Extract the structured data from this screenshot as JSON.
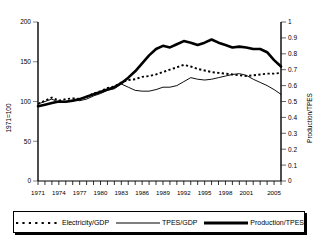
{
  "chart_data": {
    "type": "line",
    "title": "",
    "xlabel": "",
    "ylabel": "1971=100",
    "y2label": "Production/TPES",
    "xlim": [
      1971,
      2006
    ],
    "ylim": [
      0,
      200
    ],
    "y2lim": [
      0,
      1
    ],
    "grid": false,
    "legend_position": "bottom",
    "yticks": [
      "0",
      "50",
      "100",
      "150",
      "200"
    ],
    "y2ticks": [
      "0",
      "0.1",
      "0.2",
      "0.3",
      "0.4",
      "0.5",
      "0.6",
      "0.7",
      "0.8",
      "0.9",
      "1"
    ],
    "xticks": [
      "1971",
      "1974",
      "1977",
      "1980",
      "1983",
      "1986",
      "1989",
      "1992",
      "1995",
      "1998",
      "2001",
      "2005"
    ],
    "x": [
      1971,
      1972,
      1973,
      1974,
      1975,
      1976,
      1977,
      1978,
      1979,
      1980,
      1981,
      1982,
      1983,
      1984,
      1985,
      1986,
      1987,
      1988,
      1989,
      1990,
      1991,
      1992,
      1993,
      1994,
      1995,
      1996,
      1997,
      1998,
      1999,
      2000,
      2001,
      2002,
      2003,
      2004,
      2005,
      2006
    ],
    "series": [
      {
        "name": "Electricity/GDP",
        "axis": "left",
        "style": "dotted",
        "color": "#000000",
        "values": [
          97,
          101,
          105,
          101,
          103,
          104,
          103,
          106,
          110,
          113,
          117,
          119,
          124,
          127,
          128,
          131,
          132,
          134,
          137,
          140,
          143,
          146,
          144,
          141,
          139,
          137,
          136,
          135,
          134,
          133,
          132,
          133,
          134,
          135,
          135,
          136
        ]
      },
      {
        "name": "TPES/GDP",
        "axis": "left",
        "style": "solid-thin",
        "color": "#000000",
        "values": [
          97,
          100,
          103,
          99,
          100,
          102,
          101,
          103,
          107,
          110,
          114,
          116,
          122,
          118,
          114,
          113,
          113,
          115,
          118,
          118,
          120,
          125,
          130,
          128,
          127,
          128,
          130,
          132,
          134,
          135,
          133,
          128,
          124,
          120,
          115,
          109
        ]
      },
      {
        "name": "Production/TPES",
        "axis": "right",
        "style": "solid-thick",
        "color": "#000000",
        "values": [
          0.47,
          0.48,
          0.49,
          0.5,
          0.498,
          0.505,
          0.515,
          0.53,
          0.545,
          0.56,
          0.575,
          0.59,
          0.615,
          0.65,
          0.69,
          0.74,
          0.79,
          0.83,
          0.85,
          0.84,
          0.86,
          0.88,
          0.87,
          0.855,
          0.87,
          0.89,
          0.87,
          0.855,
          0.84,
          0.845,
          0.84,
          0.83,
          0.83,
          0.81,
          0.76,
          0.72
        ]
      }
    ]
  },
  "legend": {
    "items": [
      {
        "label": "Electricity/GDP",
        "style": "dotted"
      },
      {
        "label": "TPES/GDP",
        "style": "solid-thin"
      },
      {
        "label": "Production/TPES",
        "style": "solid-thick"
      }
    ]
  }
}
